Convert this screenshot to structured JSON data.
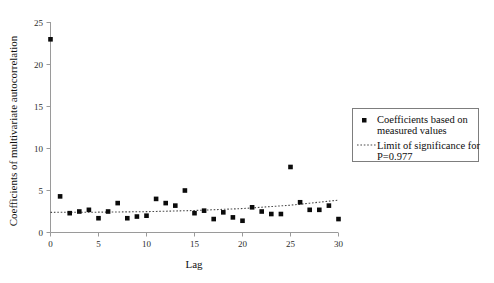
{
  "chart_data": {
    "type": "scatter",
    "title": "",
    "xlabel": "Lag",
    "ylabel": "Coefficients of multivariate autocorrelation",
    "xlim": [
      0,
      30
    ],
    "ylim": [
      0,
      25
    ],
    "xticks": [
      0,
      5,
      10,
      15,
      20,
      25,
      30
    ],
    "yticks": [
      0,
      5,
      10,
      15,
      20,
      25
    ],
    "grid": false,
    "legend_position": "right",
    "series": [
      {
        "name": "Coefficients based on measured values",
        "type": "scatter",
        "marker": "square",
        "color": "#0b0b0b",
        "x": [
          0,
          1,
          2,
          3,
          4,
          5,
          6,
          7,
          8,
          9,
          10,
          11,
          12,
          13,
          14,
          15,
          16,
          17,
          18,
          19,
          20,
          21,
          22,
          23,
          24,
          25,
          26,
          27,
          28,
          29,
          30
        ],
        "y": [
          23.0,
          4.3,
          2.3,
          2.5,
          2.7,
          1.7,
          2.5,
          3.5,
          1.7,
          1.9,
          2.0,
          4.0,
          3.5,
          3.2,
          5.0,
          2.3,
          2.6,
          1.6,
          2.4,
          1.8,
          1.4,
          3.0,
          2.5,
          2.2,
          2.2,
          7.8,
          3.6,
          2.7,
          2.7,
          3.2,
          1.6
        ]
      },
      {
        "name": "Limit of significance for P=0.977",
        "type": "line",
        "style": "dotted",
        "color": "#4a4a4a",
        "x": [
          0,
          5,
          10,
          15,
          20,
          25,
          30
        ],
        "y": [
          2.4,
          2.42,
          2.48,
          2.62,
          2.85,
          3.25,
          3.85
        ]
      }
    ]
  },
  "legend": {
    "entries": [
      {
        "marker": "square",
        "label_line1": "Coefficients based on",
        "label_line2": "measured values"
      },
      {
        "marker": "dotted-line",
        "label_line1": "Limit of significance for",
        "label_line2": "P=0.977"
      }
    ]
  },
  "axes": {
    "x_title": "Lag",
    "y_title": "Coefficients of multivariate autocorrelation",
    "x_tick_labels": [
      "0",
      "5",
      "10",
      "15",
      "20",
      "25",
      "30"
    ],
    "y_tick_labels": [
      "0",
      "5",
      "10",
      "15",
      "20",
      "25"
    ]
  },
  "colors": {
    "marker": "#0b0b0b",
    "trend": "#4a4a4a",
    "axis": "#9a9a9a",
    "text": "#101010",
    "background": "#ffffff"
  }
}
